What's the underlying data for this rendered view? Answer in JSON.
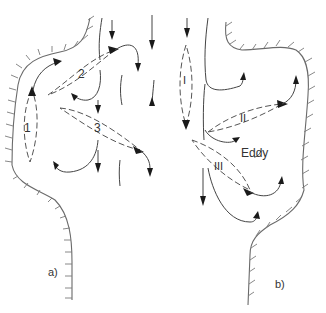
{
  "figure": {
    "panels": [
      {
        "id": "a",
        "label": "a)",
        "vortex_labels": [
          "1",
          "2",
          "3"
        ]
      },
      {
        "id": "b",
        "label": "b)",
        "vortex_labels": [
          "I",
          "II",
          "III"
        ],
        "annotation": "Eddy"
      }
    ],
    "colors": {
      "line": "#444444",
      "wall": "#6a6a6a",
      "arrowhead": "#1a1a1a",
      "background": "#ffffff"
    }
  }
}
